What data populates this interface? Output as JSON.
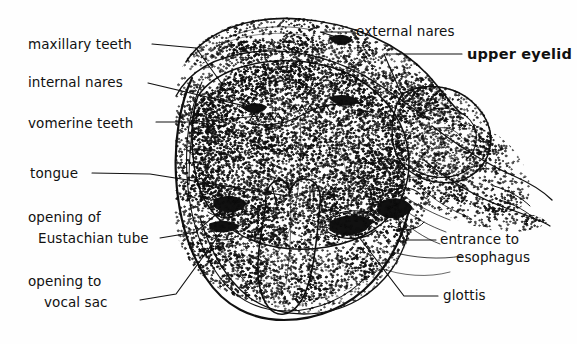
{
  "figure": {
    "style": "stippled-line-drawing",
    "ink_color": "#111111",
    "background_color": "#ffffff"
  },
  "labels": {
    "maxillary_teeth": "maxillary teeth",
    "internal_nares": "internal nares",
    "vomerine_teeth": "vomerine teeth",
    "tongue": "tongue",
    "opening_of": "opening of",
    "eustachian_tube": "Eustachian tube",
    "opening_to": "opening to",
    "vocal_sac": "vocal sac",
    "external_nares": "external nares",
    "upper_eyelid": "upper eyelid",
    "entrance_to": "entrance to",
    "esophagus": "esophagus",
    "glottis": "glottis"
  }
}
